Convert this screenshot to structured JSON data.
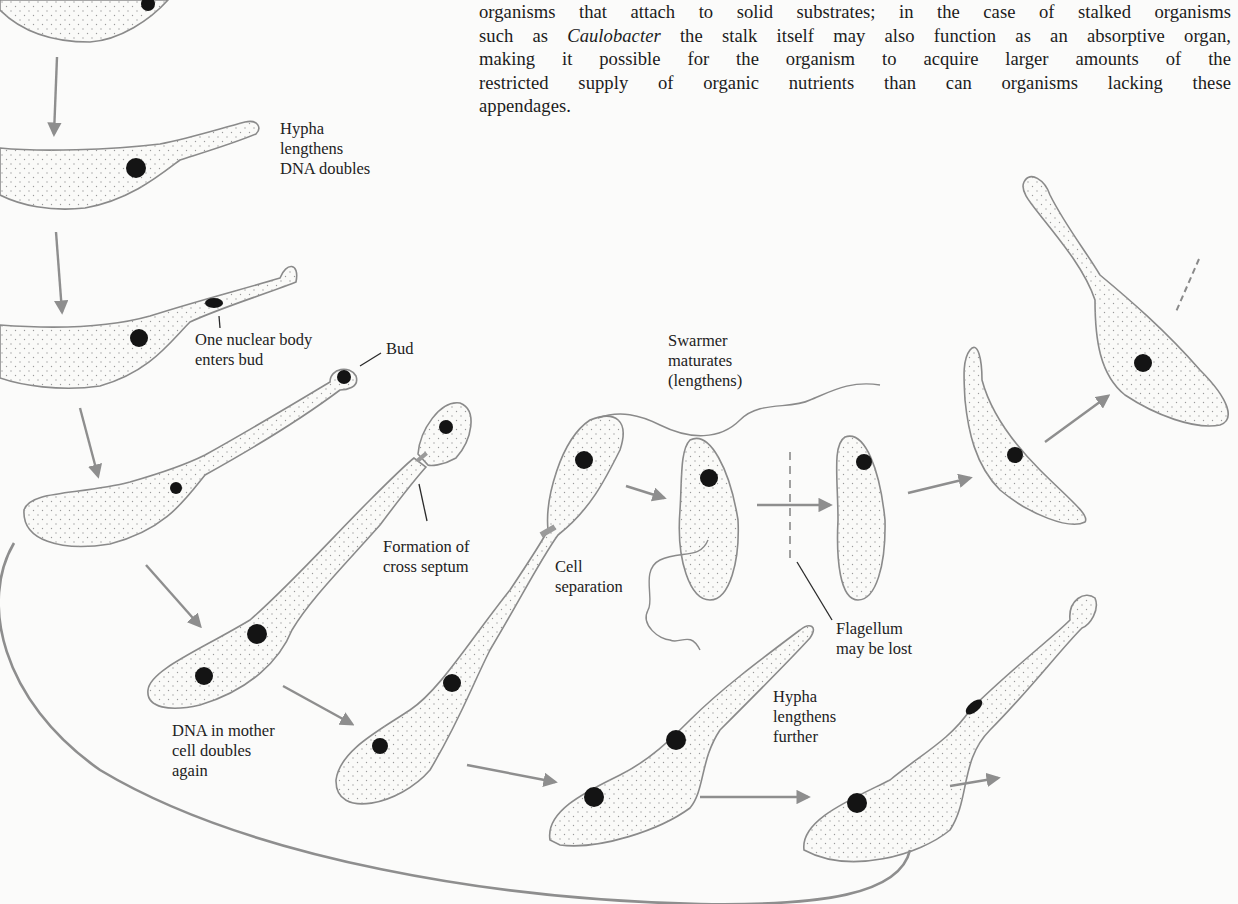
{
  "paragraph": {
    "line1": "organisms that attach to solid substrates; in the case of stalked organisms",
    "line2_pre": "such as ",
    "line2_italic": "Caulobacter",
    "line2_post": " the stalk itself may also function as an absorptive organ,",
    "line3": "making it possible for the organism to acquire larger amounts of the",
    "line4": "restricted supply of organic nutrients than can organisms lacking these",
    "line5": "appendages."
  },
  "diagram": {
    "labels": {
      "hypha_lengthens": [
        "Hypha",
        "lengthens",
        "DNA doubles"
      ],
      "nuclear_body": [
        "One nuclear body",
        "enters bud"
      ],
      "bud": "Bud",
      "swarmer": [
        "Swarmer",
        "maturates",
        "(lengthens)"
      ],
      "cross_septum": [
        "Formation of",
        "cross septum"
      ],
      "cell_separation": [
        "Cell",
        "separation"
      ],
      "flagellum_lost": [
        "Flagellum",
        "may be lost"
      ],
      "hypha_further": [
        "Hypha",
        "lengthens",
        "further"
      ],
      "dna_mother": [
        "DNA in mother",
        "cell doubles",
        "again"
      ]
    },
    "colors": {
      "outline": "#8a8a8a",
      "arrow": "#8e8e8e",
      "dna": "#141414",
      "text": "#1c1c1c",
      "background": "#fbfbfa"
    }
  }
}
